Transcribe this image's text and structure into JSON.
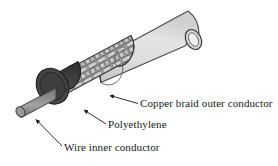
{
  "figure": {
    "background_color": "#ffffff"
  },
  "labels": {
    "outer_conductor": "Copper braid outer conductor",
    "dielectric": "Polyethylene",
    "inner_conductor": "Wire inner conductor"
  },
  "parts": {
    "jacket": {
      "name": "outer plastic jacket",
      "color": "#d8d8d8",
      "stroke": "#4a4a4a"
    },
    "braid": {
      "name": "copper braid outer conductor",
      "color": "#bdbdbd",
      "strand_color": "#c9c9c9",
      "stroke": "#3c3c3c"
    },
    "dielectric": {
      "name": "polyethylene insulator",
      "color": "#3a3a3a",
      "face_color": "#454545",
      "stroke": "#1f1f1f"
    },
    "inner_conductor": {
      "name": "wire inner conductor",
      "color": "#8c8c8c",
      "stroke": "#3a3a3a"
    },
    "leader_line": {
      "name": "leader line with arrowhead",
      "color": "#1a1a1a"
    }
  },
  "colors": {
    "line": "#1a1a1a",
    "text": "#1a1a1a"
  }
}
